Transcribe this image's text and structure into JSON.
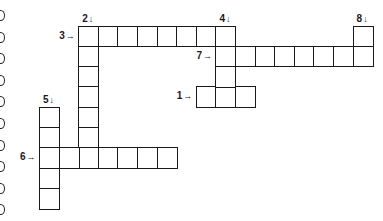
{
  "puzzle": {
    "type": "crossword",
    "grid": {
      "origin_x": 39,
      "origin_y": 25.5,
      "cell_w": 19.6,
      "cell_h": 20.3
    },
    "entries": [
      {
        "number": "1",
        "direction": "across",
        "arrow": "→",
        "row": 3,
        "col": 8,
        "length": 3
      },
      {
        "number": "2",
        "direction": "down",
        "arrow": "↓",
        "row": 0,
        "col": 2,
        "length": 7
      },
      {
        "number": "3",
        "direction": "across",
        "arrow": "→",
        "row": 0,
        "col": 2,
        "length": 8
      },
      {
        "number": "4",
        "direction": "down",
        "arrow": "↓",
        "row": 0,
        "col": 9,
        "length": 4
      },
      {
        "number": "5",
        "direction": "down",
        "arrow": "↓",
        "row": 4,
        "col": 0,
        "length": 5
      },
      {
        "number": "6",
        "direction": "across",
        "arrow": "→",
        "row": 6,
        "col": 0,
        "length": 7
      },
      {
        "number": "7",
        "direction": "across",
        "arrow": "→",
        "row": 1,
        "col": 9,
        "length": 8
      },
      {
        "number": "8",
        "direction": "down",
        "arrow": "↓",
        "row": 0,
        "col": 16,
        "length": 2
      }
    ]
  },
  "binding_rings": [
    15,
    37,
    58,
    80,
    101,
    123,
    145,
    166,
    188,
    209
  ]
}
